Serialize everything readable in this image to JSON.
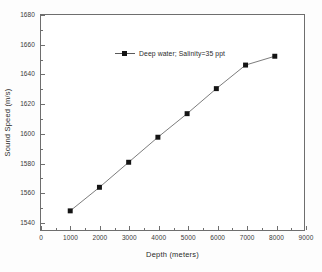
{
  "chart_data": {
    "type": "line",
    "title": "",
    "xlabel": "Depth (meters)",
    "ylabel": "Sound Speed (m/s)",
    "xlim": [
      0,
      9000
    ],
    "ylim": [
      1534,
      1680
    ],
    "xticks": [
      0,
      1000,
      2000,
      3000,
      4000,
      5000,
      6000,
      7000,
      8000,
      9000
    ],
    "xticklabels": [
      "0",
      "1000",
      "2000",
      "3000",
      "4000",
      "5000",
      "6000",
      "7000",
      "8000",
      "9000"
    ],
    "yticks": [
      1540,
      1560,
      1580,
      1600,
      1620,
      1640,
      1660,
      1680
    ],
    "yticklabels": [
      "1540",
      "1560",
      "1580",
      "1600",
      "1620",
      "1640",
      "1660",
      "1680"
    ],
    "minor_ticks": true,
    "grid": false,
    "legend_position": "upper-left-inside",
    "marker": "filled-square",
    "line_color": "#5a5a5a",
    "marker_color": "#141414",
    "series": [
      {
        "name": "Deep water; Salinity=35 ppt",
        "x": [
          1000,
          2000,
          3000,
          4000,
          5000,
          6000,
          7000,
          8000
        ],
        "values": [
          1547,
          1563,
          1580,
          1597,
          1613,
          1630,
          1646,
          1652
        ]
      }
    ]
  },
  "legend": {
    "entries": [
      {
        "label": "Deep water; Salinity=35 ppt",
        "marker": "filled-square",
        "color": "#141414"
      }
    ]
  }
}
